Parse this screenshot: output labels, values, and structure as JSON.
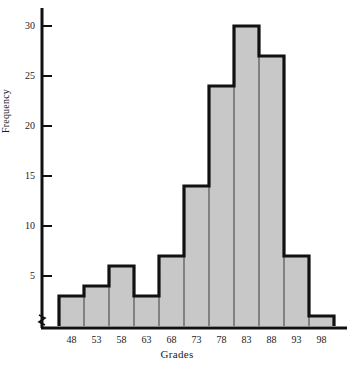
{
  "chart_data": {
    "type": "bar",
    "title": "",
    "subtitle": "",
    "xlabel": "Grades",
    "ylabel": "Frequency",
    "categories": [
      "48",
      "53",
      "58",
      "63",
      "68",
      "73",
      "78",
      "83",
      "88",
      "93",
      "98"
    ],
    "values": [
      3,
      4,
      6,
      3,
      7,
      14,
      24,
      30,
      27,
      7,
      1
    ],
    "series": [
      {
        "name": "Frequency",
        "values": [
          3,
          4,
          6,
          3,
          7,
          14,
          24,
          30,
          27,
          7,
          1
        ]
      }
    ],
    "xlim": [
      45.5,
      100.5
    ],
    "ylim": [
      0,
      32
    ],
    "yticks": [
      5,
      10,
      15,
      20,
      25,
      30
    ],
    "ytick_labels": [
      "5",
      "10",
      "15",
      "20",
      "25",
      "30"
    ],
    "xtick_labels": [
      "48",
      "53",
      "58",
      "63",
      "68",
      "73",
      "78",
      "83",
      "88",
      "93",
      "98"
    ],
    "grid": false,
    "legend": "none",
    "bin_width": 5,
    "axis_break": "zigzag-at-origin",
    "colors": {
      "bar_fill": "#c8c8c8",
      "bar_edge": "#111111",
      "axis": "#111111",
      "text": "#1a1a1a",
      "background": "#ffffff"
    }
  },
  "axes": {
    "y_axis_name": "frequency-axis",
    "x_axis_name": "grades-axis"
  }
}
